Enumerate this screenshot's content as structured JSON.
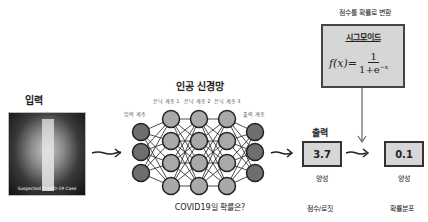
{
  "input": {
    "title": "입력",
    "image_caption": "Suspected COVID-19 Case"
  },
  "network": {
    "title": "인공 신경망",
    "layer_labels": {
      "input": "입력 계층",
      "hidden1": "은닉 계층 1",
      "hidden2": "은닉 계층 2",
      "hidden3": "은닉 계층 3",
      "output": "출력 계층"
    },
    "question": "COVID19일 확률은?"
  },
  "output": {
    "title": "출력",
    "score_value": "3.7",
    "score_label": "양성",
    "score_caption": "점수/로짓"
  },
  "sigmoid": {
    "header": "점수를 확률로 변환",
    "title": "시그모이드",
    "formula_lhs": "f(x)=",
    "formula_num": "1",
    "formula_den": "1+e",
    "formula_exp": "−x"
  },
  "probability": {
    "value": "0.1",
    "label": "양성",
    "caption": "확률분포"
  },
  "colors": {
    "node_io": "#6e6e6e",
    "node_hidden": "#a9a9a9",
    "box_fill": "#d6d6d6",
    "stroke": "#222222"
  }
}
